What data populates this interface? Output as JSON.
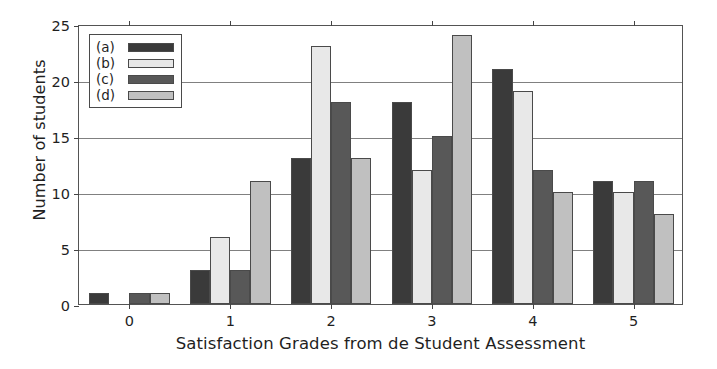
{
  "chart_data": {
    "type": "bar",
    "title": "",
    "xlabel": "Satisfaction Grades from de Student Assessment",
    "ylabel": "Number of students",
    "categories": [
      "0",
      "1",
      "2",
      "3",
      "4",
      "5"
    ],
    "xlim": [
      -0.5,
      5.5
    ],
    "ylim": [
      0,
      25
    ],
    "yticks": [
      0,
      5,
      10,
      15,
      20,
      25
    ],
    "ytick_labels": [
      "0",
      "5",
      "10",
      "15",
      "20",
      "25"
    ],
    "xtick_labels": [
      "0",
      "1",
      "2",
      "3",
      "4",
      "5"
    ],
    "grid": "horizontal",
    "legend_position": "upper left",
    "series": [
      {
        "name": "(a)",
        "color": "#3a3a3a",
        "values": [
          1,
          3,
          13,
          18,
          21,
          11
        ]
      },
      {
        "name": "(b)",
        "color": "#e8e8e8",
        "values": [
          0,
          6,
          23,
          12,
          19,
          10
        ]
      },
      {
        "name": "(c)",
        "color": "#585858",
        "values": [
          1,
          3,
          18,
          15,
          12,
          11
        ]
      },
      {
        "name": "(d)",
        "color": "#c0c0c0",
        "values": [
          1,
          11,
          13,
          24,
          10,
          8
        ]
      }
    ]
  },
  "legend": {
    "entries": [
      {
        "label": "(a)",
        "color": "#3a3a3a"
      },
      {
        "label": "(b)",
        "color": "#e8e8e8"
      },
      {
        "label": "(c)",
        "color": "#585858"
      },
      {
        "label": "(d)",
        "color": "#c0c0c0"
      }
    ]
  },
  "axes": {
    "x_title": "Satisfaction Grades from de Student Assessment",
    "y_title": "Number of students"
  },
  "colors": {
    "series_a": "#3a3a3a",
    "series_b": "#e8e8e8",
    "series_c": "#585858",
    "series_d": "#c0c0c0",
    "frame": "#545454",
    "grid": "#6a6a6a",
    "background": "#ffffff",
    "text": "#1f1f1f"
  }
}
